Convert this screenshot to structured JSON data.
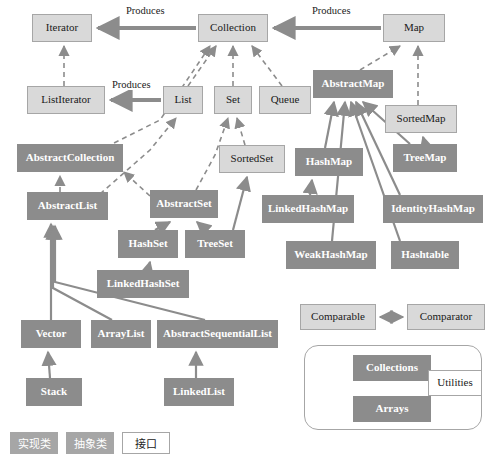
{
  "diagram": {
    "colors": {
      "interface_fill": "#d9d9d9",
      "interface_border": "#a6a6a6",
      "class_fill": "#8c8c8c",
      "class_text": "#ffffff",
      "utility_fill": "#ffffff",
      "edge": "#8c8c8c",
      "background": "#ffffff"
    },
    "nodes": [
      {
        "id": "iterator",
        "label": "Iterator",
        "kind": "interface",
        "x": 32,
        "y": 14,
        "w": 60,
        "h": 28
      },
      {
        "id": "collection",
        "label": "Collection",
        "kind": "interface",
        "x": 198,
        "y": 14,
        "w": 70,
        "h": 28
      },
      {
        "id": "map",
        "label": "Map",
        "kind": "interface",
        "x": 383,
        "y": 14,
        "w": 62,
        "h": 28
      },
      {
        "id": "listiterator",
        "label": "ListIterator",
        "kind": "interface",
        "x": 27,
        "y": 86,
        "w": 78,
        "h": 28
      },
      {
        "id": "list",
        "label": "List",
        "kind": "interface",
        "x": 163,
        "y": 86,
        "w": 40,
        "h": 28
      },
      {
        "id": "set",
        "label": "Set",
        "kind": "interface",
        "x": 214,
        "y": 86,
        "w": 38,
        "h": 28
      },
      {
        "id": "queue",
        "label": "Queue",
        "kind": "interface",
        "x": 259,
        "y": 86,
        "w": 52,
        "h": 28
      },
      {
        "id": "abstractmap",
        "label": "AbstractMap",
        "kind": "class",
        "x": 313,
        "y": 70,
        "w": 80,
        "h": 28
      },
      {
        "id": "sortedmap",
        "label": "SortedMap",
        "kind": "interface",
        "x": 385,
        "y": 105,
        "w": 72,
        "h": 28
      },
      {
        "id": "abstractcollection",
        "label": "AbstractCollection",
        "kind": "class",
        "x": 17,
        "y": 144,
        "w": 106,
        "h": 28
      },
      {
        "id": "sortedset",
        "label": "SortedSet",
        "kind": "interface",
        "x": 219,
        "y": 145,
        "w": 66,
        "h": 28
      },
      {
        "id": "hashmap",
        "label": "HashMap",
        "kind": "class",
        "x": 295,
        "y": 148,
        "w": 68,
        "h": 28
      },
      {
        "id": "treemap",
        "label": "TreeMap",
        "kind": "class",
        "x": 393,
        "y": 144,
        "w": 64,
        "h": 28
      },
      {
        "id": "abstractlist",
        "label": "AbstractList",
        "kind": "class",
        "x": 27,
        "y": 192,
        "w": 81,
        "h": 28
      },
      {
        "id": "abstractset",
        "label": "AbstractSet",
        "kind": "class",
        "x": 150,
        "y": 190,
        "w": 68,
        "h": 28
      },
      {
        "id": "linkedhashmap",
        "label": "LinkedHashMap",
        "kind": "class",
        "x": 262,
        "y": 195,
        "w": 92,
        "h": 28
      },
      {
        "id": "identityhashmap",
        "label": "IdentityHashMap",
        "kind": "class",
        "x": 383,
        "y": 195,
        "w": 100,
        "h": 28
      },
      {
        "id": "hashset",
        "label": "HashSet",
        "kind": "class",
        "x": 118,
        "y": 230,
        "w": 60,
        "h": 28
      },
      {
        "id": "treeset",
        "label": "TreeSet",
        "kind": "class",
        "x": 185,
        "y": 230,
        "w": 60,
        "h": 28
      },
      {
        "id": "weakhashmap",
        "label": "WeakHashMap",
        "kind": "class",
        "x": 286,
        "y": 241,
        "w": 90,
        "h": 28
      },
      {
        "id": "hashtable",
        "label": "Hashtable",
        "kind": "class",
        "x": 391,
        "y": 241,
        "w": 68,
        "h": 28
      },
      {
        "id": "linkedhashset",
        "label": "LinkedHashSet",
        "kind": "class",
        "x": 97,
        "y": 270,
        "w": 92,
        "h": 28
      },
      {
        "id": "comparable",
        "label": "Comparable",
        "kind": "interface",
        "x": 300,
        "y": 304,
        "w": 76,
        "h": 26
      },
      {
        "id": "comparator",
        "label": "Comparator",
        "kind": "interface",
        "x": 407,
        "y": 304,
        "w": 78,
        "h": 26
      },
      {
        "id": "vector",
        "label": "Vector",
        "kind": "class",
        "x": 21,
        "y": 320,
        "w": 60,
        "h": 28
      },
      {
        "id": "arraylist",
        "label": "ArrayList",
        "kind": "class",
        "x": 91,
        "y": 320,
        "w": 60,
        "h": 28
      },
      {
        "id": "abstractsequentiallist",
        "label": "AbstractSequentialList",
        "kind": "class",
        "x": 157,
        "y": 320,
        "w": 121,
        "h": 28
      },
      {
        "id": "collections",
        "label": "Collections",
        "kind": "class",
        "x": 353,
        "y": 355,
        "w": 78,
        "h": 26
      },
      {
        "id": "arrays",
        "label": "Arrays",
        "kind": "class",
        "x": 353,
        "y": 396,
        "w": 78,
        "h": 26
      },
      {
        "id": "utilities",
        "label": "Utilities",
        "kind": "utility",
        "x": 428,
        "y": 370,
        "w": 54,
        "h": 26
      },
      {
        "id": "stack",
        "label": "Stack",
        "kind": "class",
        "x": 26,
        "y": 378,
        "w": 56,
        "h": 28
      },
      {
        "id": "linkedlist",
        "label": "LinkedList",
        "kind": "class",
        "x": 164,
        "y": 378,
        "w": 70,
        "h": 28
      }
    ],
    "edge_labels": [
      {
        "id": "produces-iterator",
        "text": "Produces",
        "x": 124,
        "y": 5
      },
      {
        "id": "produces-map",
        "text": "Produces",
        "x": 310,
        "y": 5
      },
      {
        "id": "produces-listiterator",
        "text": "Produces",
        "x": 110,
        "y": 79
      }
    ],
    "relations": [
      {
        "from": "collection",
        "to": "iterator",
        "type": "produces"
      },
      {
        "from": "map",
        "to": "collection",
        "type": "produces"
      },
      {
        "from": "list",
        "to": "listiterator",
        "type": "produces"
      },
      {
        "from": "listiterator",
        "to": "iterator",
        "type": "extends-interface"
      },
      {
        "from": "list",
        "to": "collection",
        "type": "extends-interface"
      },
      {
        "from": "set",
        "to": "collection",
        "type": "extends-interface"
      },
      {
        "from": "queue",
        "to": "collection",
        "type": "extends-interface"
      },
      {
        "from": "sortedset",
        "to": "set",
        "type": "extends-interface"
      },
      {
        "from": "sortedmap",
        "to": "map",
        "type": "extends-interface"
      },
      {
        "from": "abstractmap",
        "to": "map",
        "type": "implements"
      },
      {
        "from": "abstractcollection",
        "to": "collection",
        "type": "implements"
      },
      {
        "from": "abstractlist",
        "to": "list",
        "type": "implements"
      },
      {
        "from": "abstractset",
        "to": "set",
        "type": "implements"
      },
      {
        "from": "abstractlist",
        "to": "abstractcollection",
        "type": "extends"
      },
      {
        "from": "abstractset",
        "to": "abstractcollection",
        "type": "extends"
      },
      {
        "from": "hashset",
        "to": "abstractset",
        "type": "extends"
      },
      {
        "from": "treeset",
        "to": "abstractset",
        "type": "extends"
      },
      {
        "from": "treeset",
        "to": "sortedset",
        "type": "implements"
      },
      {
        "from": "linkedhashset",
        "to": "hashset",
        "type": "extends"
      },
      {
        "from": "hashmap",
        "to": "abstractmap",
        "type": "extends"
      },
      {
        "from": "treemap",
        "to": "abstractmap",
        "type": "extends"
      },
      {
        "from": "identityhashmap",
        "to": "abstractmap",
        "type": "extends"
      },
      {
        "from": "weakhashmap",
        "to": "abstractmap",
        "type": "extends"
      },
      {
        "from": "hashtable",
        "to": "abstractmap",
        "type": "extends"
      },
      {
        "from": "linkedhashmap",
        "to": "hashmap",
        "type": "extends"
      },
      {
        "from": "treemap",
        "to": "sortedmap",
        "type": "implements"
      },
      {
        "from": "vector",
        "to": "abstractlist",
        "type": "extends"
      },
      {
        "from": "arraylist",
        "to": "abstractlist",
        "type": "extends"
      },
      {
        "from": "abstractsequentiallist",
        "to": "abstractlist",
        "type": "extends"
      },
      {
        "from": "stack",
        "to": "vector",
        "type": "extends"
      },
      {
        "from": "linkedlist",
        "to": "abstractsequentiallist",
        "type": "extends"
      },
      {
        "from": "comparable",
        "to": "comparator",
        "type": "bidirectional"
      }
    ],
    "utility_group": {
      "id": "utility-group",
      "x": 304,
      "y": 345,
      "w": 178,
      "h": 85
    },
    "legend": {
      "x": 10,
      "y": 432,
      "items": [
        {
          "id": "legend-impl",
          "label": "实现类",
          "kind": "class"
        },
        {
          "id": "legend-abst",
          "label": "抽象类",
          "kind": "abstract"
        },
        {
          "id": "legend-iface",
          "label": "接口",
          "kind": "interface"
        }
      ]
    }
  }
}
